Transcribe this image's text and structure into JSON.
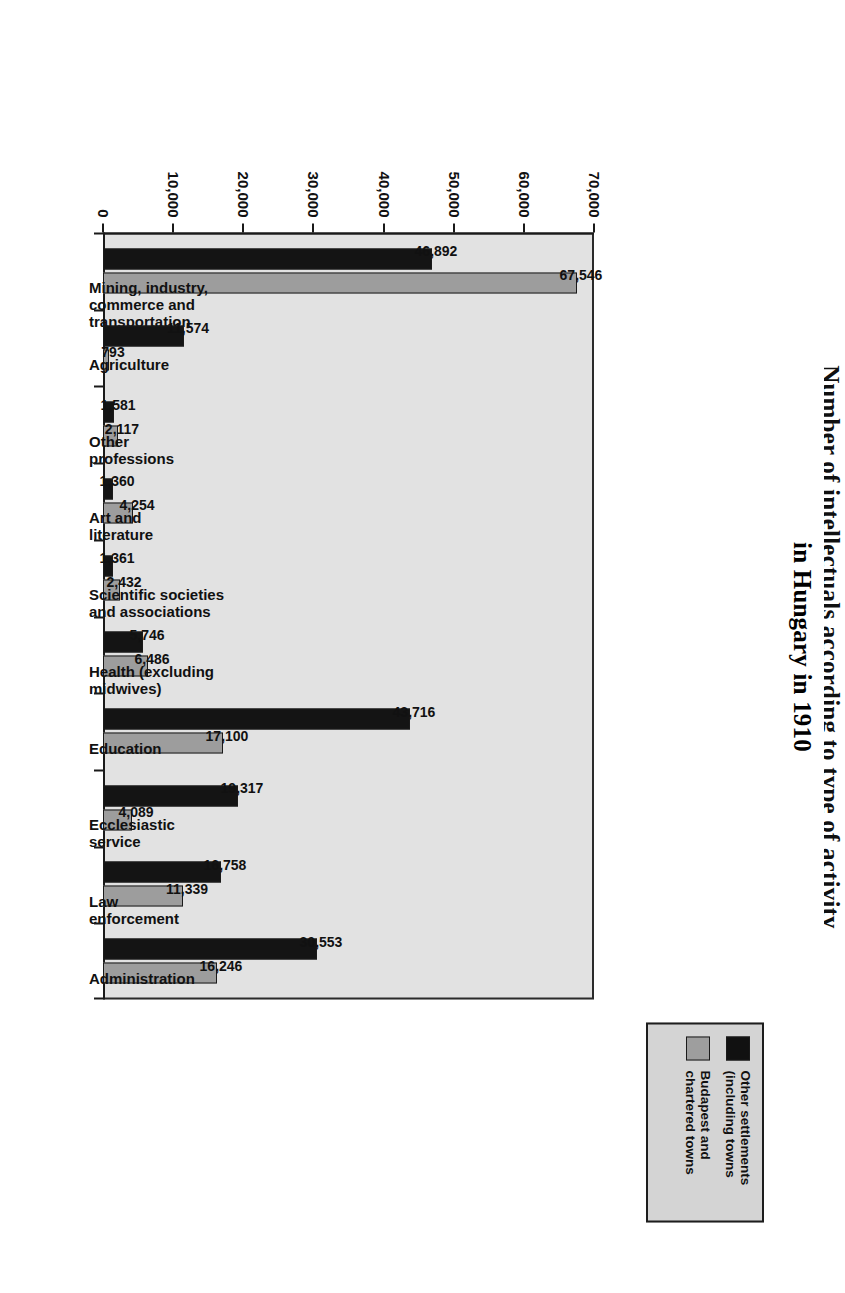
{
  "chart_data": {
    "type": "bar",
    "title": "Number of intellectuals according to type of activity",
    "title_line1": "Number of intellectuals according to type of activity",
    "title_line2": "in Hungary in 1910",
    "xlabel": "",
    "ylabel": "",
    "ylim": [
      0,
      70000
    ],
    "grid": false,
    "legend_position": "top-right",
    "categories": [
      "Mining, industry,\ncommerce and\ntransportation",
      "Agriculture",
      "Other\nprofessions",
      "Art and\nliterature",
      "Scientific societies\nand associations",
      "Health (excluding\nmidwives)",
      "Education",
      "Ecclesiastic\nservice",
      "Law\nenforcement",
      "Administration"
    ],
    "series": [
      {
        "name": "Other settlements\n(including towns",
        "color": "#141414",
        "values": [
          46892,
          11574,
          1581,
          1360,
          1361,
          5746,
          43716,
          19317,
          16758,
          30553
        ],
        "labels": [
          "46,892",
          "11,574",
          "1,581",
          "1,360",
          "1,361",
          "5,746",
          "43,716",
          "19,317",
          "16,758",
          "30,553"
        ]
      },
      {
        "name": "Budapest and\nchartered towns",
        "color": "#9d9d9d",
        "values": [
          67546,
          793,
          2117,
          4254,
          2432,
          6486,
          17100,
          4089,
          11339,
          16246
        ],
        "labels": [
          "67,546",
          "793",
          "2,117",
          "4,254",
          "2,432",
          "6,486",
          "17,100",
          "4,089",
          "11,339",
          "16,246"
        ]
      }
    ],
    "y_ticks": [
      0,
      10000,
      20000,
      30000,
      40000,
      50000,
      60000,
      70000
    ],
    "y_tick_labels": [
      "0",
      "10,000",
      "20,000",
      "30,000",
      "40,000",
      "50,000",
      "60,000",
      "70,000"
    ]
  },
  "legend": {
    "items": [
      {
        "label": "Other settlements\n(including towns",
        "swatch": "dark"
      },
      {
        "label": "Budapest and\nchartered towns",
        "swatch": "light"
      }
    ]
  },
  "colors": {
    "series_dark": "#141414",
    "series_light": "#9d9d9d",
    "plot_background": "#e2e2e2",
    "legend_background": "#d4d4d4",
    "axis": "#1a1a1a"
  }
}
